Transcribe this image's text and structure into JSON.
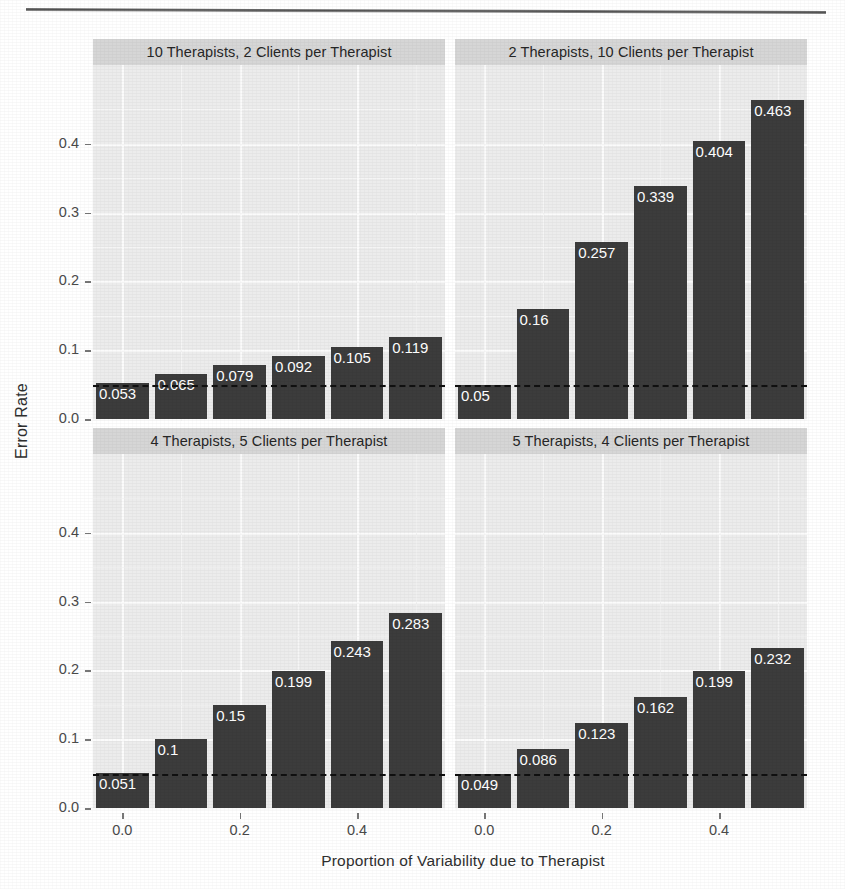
{
  "chart_data": {
    "type": "bar",
    "title": "",
    "xlabel": "Proportion of Variability due to Therapist",
    "ylabel": "Error Rate",
    "xlim": [
      -0.05,
      0.55
    ],
    "ylim": [
      0.0,
      0.49
    ],
    "x_ticks": [
      "0.0",
      "0.2",
      "0.4"
    ],
    "x_tick_values": [
      0.0,
      0.2,
      0.4
    ],
    "y_ticks": [
      "0.0",
      "0.1",
      "0.2",
      "0.3",
      "0.4"
    ],
    "y_tick_values": [
      0.0,
      0.1,
      0.2,
      0.3,
      0.4
    ],
    "grid": true,
    "legend": "none",
    "reference_line": {
      "value": 0.05,
      "style": "dashed",
      "color": "#101010"
    },
    "bar_color": "#3c3c3c",
    "panel_background": "#ececec",
    "strip_background": "#d6d6d6",
    "x": [
      0.0,
      0.1,
      0.2,
      0.3,
      0.4,
      0.5
    ],
    "facets": [
      {
        "label": "10 Therapists, 2 Clients per Therapist",
        "values": [
          0.053,
          0.065,
          0.079,
          0.092,
          0.105,
          0.119
        ],
        "labels": [
          "0.053",
          "0.065",
          "0.079",
          "0.092",
          "0.105",
          "0.119"
        ]
      },
      {
        "label": "2 Therapists, 10 Clients per Therapist",
        "values": [
          0.05,
          0.16,
          0.257,
          0.339,
          0.404,
          0.463
        ],
        "labels": [
          "0.05",
          "0.16",
          "0.257",
          "0.339",
          "0.404",
          "0.463"
        ]
      },
      {
        "label": "4 Therapists, 5 Clients per Therapist",
        "values": [
          0.051,
          0.1,
          0.15,
          0.199,
          0.243,
          0.283
        ],
        "labels": [
          "0.051",
          "0.1",
          "0.15",
          "0.199",
          "0.243",
          "0.283"
        ]
      },
      {
        "label": "5 Therapists, 4 Clients per Therapist",
        "values": [
          0.049,
          0.086,
          0.123,
          0.162,
          0.199,
          0.232
        ],
        "labels": [
          "0.049",
          "0.086",
          "0.123",
          "0.162",
          "0.199",
          "0.232"
        ]
      }
    ]
  }
}
